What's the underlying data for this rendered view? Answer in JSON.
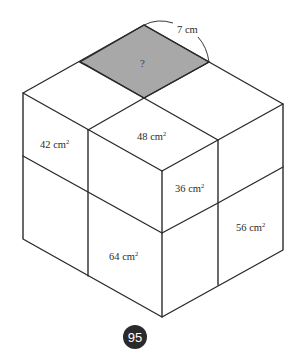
{
  "diagram": {
    "type": "cuboid-face-areas",
    "colors": {
      "edge": "#2b2b2b",
      "shaded_region": "#a8a8a8",
      "page_badge": "#2a2a2a"
    },
    "shaded_region_label": "?",
    "dimension_label": "7 cm",
    "top_face_labels": {
      "front_quadrant": "48 cm",
      "front_quadrant_sup": "2"
    },
    "left_face_labels": {
      "top_left": "42 cm",
      "top_left_sup": "2",
      "bottom_right": "64 cm",
      "bottom_right_sup": "2"
    },
    "right_face_labels": {
      "top_left": "36 cm",
      "top_left_sup": "2",
      "bottom_right": "56 cm",
      "bottom_right_sup": "2"
    }
  },
  "page": {
    "number": "95"
  }
}
